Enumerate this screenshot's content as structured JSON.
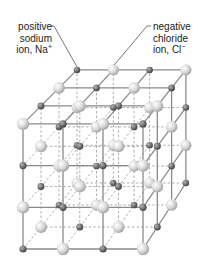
{
  "labels": {
    "cation": {
      "line1": "positive",
      "line2": "sodium",
      "line3_prefix": "ion, Na",
      "charge": "+"
    },
    "anion": {
      "line1": "negative",
      "line2": "chloride",
      "line3_prefix": "ion, Cl",
      "charge": "−"
    }
  },
  "lattice": {
    "points_per_edge": 4,
    "cation_name": "Na+",
    "anion_name": "Cl-",
    "colors": {
      "cation": "#6e6e6e",
      "anion": "#d6d6d6",
      "edge": "#8a8a8a",
      "hidden_edge": "#9a9a9a",
      "leader": "#555555"
    }
  }
}
